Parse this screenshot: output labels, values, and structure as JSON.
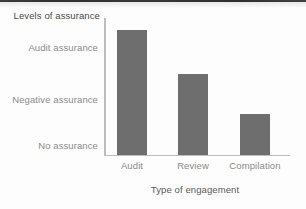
{
  "chart_data": {
    "type": "bar",
    "title": "",
    "xlabel": "Type of engagement",
    "ylabel": "Levels of assurance",
    "categories": [
      "Audit",
      "Review",
      "Compilation"
    ],
    "values": [
      3,
      2,
      1.1
    ],
    "value_labels": [
      "Audit assurance",
      "Negative assurance",
      "Slightly above no assurance"
    ],
    "ytick_labels": [
      "No assurance",
      "Negative assurance",
      "Audit assurance"
    ],
    "ytick_values": [
      1,
      2,
      3
    ],
    "ylim": [
      0.17,
      3.28
    ],
    "grid": false,
    "legend": false,
    "bar_color": "#6e6e6e",
    "axis_color": "#bdbdbd",
    "series": [
      {
        "name": "Level of assurance",
        "values": [
          3,
          2,
          1.1
        ]
      }
    ]
  },
  "axes": {
    "y_title": "Levels of assurance",
    "x_title": "Type of engagement",
    "y_ticks": [
      {
        "label": "Audit assurance"
      },
      {
        "label": "Negative assurance"
      },
      {
        "label": "No assurance"
      }
    ],
    "x_ticks": [
      {
        "label": "Audit"
      },
      {
        "label": "Review"
      },
      {
        "label": "Compilation"
      }
    ]
  }
}
